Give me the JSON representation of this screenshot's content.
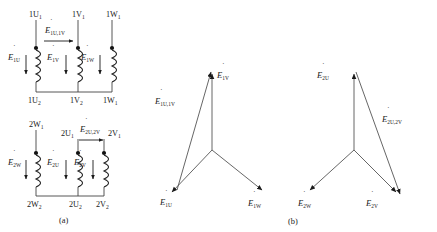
{
  "figure": {
    "panels": [
      {
        "id": "a",
        "caption": "(a)",
        "description": "winding-connection-diagram"
      },
      {
        "id": "b",
        "caption": "(b)",
        "description": "phasor-star-diagram"
      }
    ]
  },
  "panel_a": {
    "caption": "(a)",
    "upper_circuit": {
      "name": "primary-winding-group-1",
      "top_terminals": [
        "1U",
        "1V",
        "1W"
      ],
      "top_terminal_subs": [
        "1",
        "1",
        "1"
      ],
      "bottom_terminals": [
        "1U",
        "1V",
        "1W"
      ],
      "bottom_terminal_subs": [
        "2",
        "2",
        "1"
      ],
      "coil_emfs": [
        {
          "symbol": "E",
          "sub": "1U"
        },
        {
          "symbol": "E",
          "sub": "1V"
        },
        {
          "symbol": "E",
          "sub": "1W"
        }
      ],
      "line_emf": {
        "symbol": "E",
        "sub": "1U,1V"
      },
      "polarity_dots": 3,
      "arrow_direction": "down",
      "line_arrow_direction": "right"
    },
    "lower_circuit": {
      "name": "secondary-winding-group-2",
      "top_terminals": [
        "2W",
        "2U",
        "2V"
      ],
      "top_terminal_subs": [
        "1",
        "1",
        "1"
      ],
      "bottom_terminals": [
        "2W",
        "2U",
        "2V"
      ],
      "bottom_terminal_subs": [
        "2",
        "2",
        "2"
      ],
      "coil_emfs": [
        {
          "symbol": "E",
          "sub": "2W"
        },
        {
          "symbol": "E",
          "sub": "2U"
        },
        {
          "symbol": "E",
          "sub": "2V"
        }
      ],
      "line_emf": {
        "symbol": "E",
        "sub": "2U,2V"
      },
      "polarity_dots": 3,
      "arrow_direction": "down",
      "line_arrow_direction": "right"
    }
  },
  "panel_b": {
    "caption": "(b)",
    "left_star": {
      "name": "phasor-star-group-1",
      "vectors": [
        {
          "symbol": "E",
          "sub": "1V",
          "direction": "up"
        },
        {
          "symbol": "E",
          "sub": "1U",
          "direction": "down-left"
        },
        {
          "symbol": "E",
          "sub": "1W",
          "direction": "down-right"
        }
      ],
      "line_vector": {
        "symbol": "E",
        "sub": "1U,1V",
        "direction": "up-right"
      }
    },
    "right_star": {
      "name": "phasor-star-group-2",
      "vectors": [
        {
          "symbol": "E",
          "sub": "2U",
          "direction": "up"
        },
        {
          "symbol": "E",
          "sub": "2W",
          "direction": "down-left"
        },
        {
          "symbol": "E",
          "sub": "2V",
          "direction": "down-right"
        }
      ],
      "line_vector": {
        "symbol": "E",
        "sub": "2U,2V",
        "direction": "down-right"
      }
    }
  },
  "colors": {
    "ink": "#1a1a1a",
    "line": "#555555",
    "background": "#ffffff"
  }
}
